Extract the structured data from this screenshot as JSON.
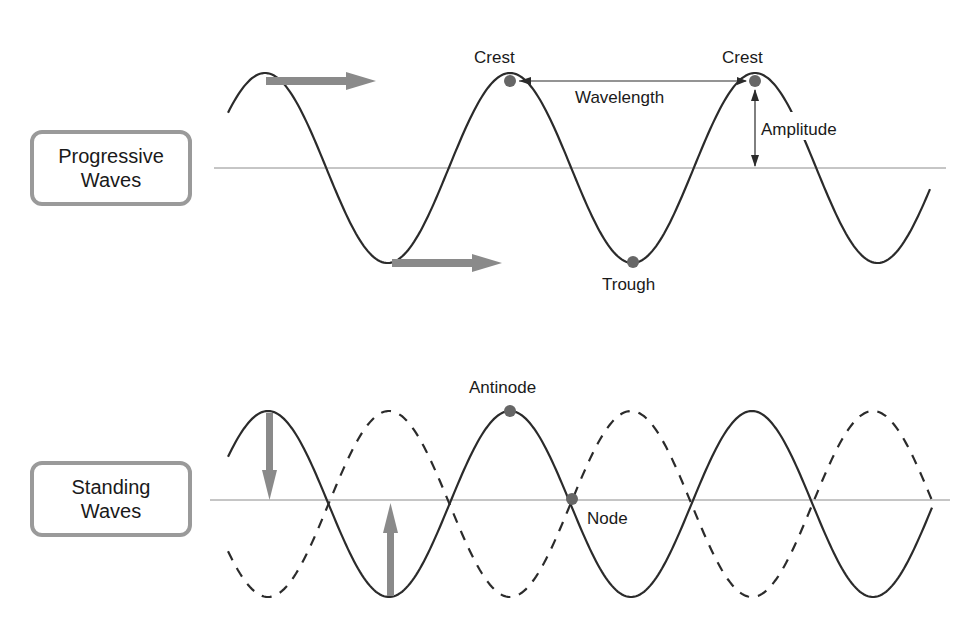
{
  "progressive": {
    "title_line1": "Progressive",
    "title_line2": "Waves",
    "labels": {
      "crest_1": "Crest",
      "crest_2": "Crest",
      "wavelength": "Wavelength",
      "amplitude": "Amplitude",
      "trough": "Trough"
    }
  },
  "standing": {
    "title_line1": "Standing",
    "title_line2": "Waves",
    "labels": {
      "antinode": "Antinode",
      "node": "Node"
    }
  },
  "colors": {
    "wave": "#2b2b2b",
    "axis": "#8c8c8c",
    "arrow": "#8a8a8a",
    "marker": "#666666",
    "box_border": "#9a9a9a"
  }
}
